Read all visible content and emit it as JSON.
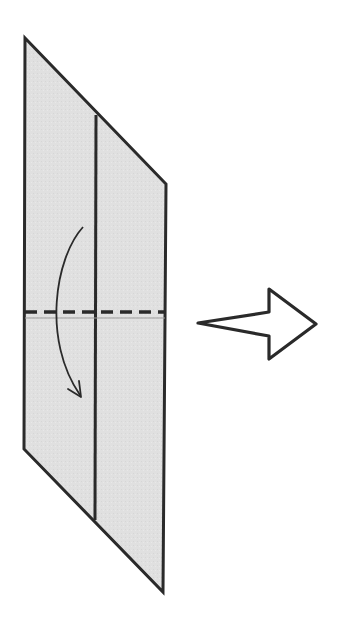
{
  "diagram": {
    "type": "origami-fold-step",
    "colors": {
      "paper_fill": "#e0e0e0",
      "stroke": "#2a2a2a",
      "crease_line": "#9a9a9a",
      "background": "#ffffff"
    },
    "paper": {
      "outline": "25,38 166,184 163,592 24,449",
      "center_crease": {
        "x1": 96,
        "y1": 115,
        "x2": 95,
        "y2": 520
      }
    },
    "valley_fold_line": {
      "x1": 25,
      "y1": 312,
      "x2": 164,
      "y2": 312,
      "style": "dashed"
    },
    "reference_line": {
      "x1": 25,
      "y1": 318,
      "x2": 165,
      "y2": 318
    },
    "fold_direction_arrow": {
      "path": "M83,227 C55,258 42,340 80,395",
      "direction": "down"
    },
    "next_step_arrow": {
      "outline": "198,323 269,312 269,289 316,324 269,359 269,336",
      "direction": "right"
    }
  }
}
